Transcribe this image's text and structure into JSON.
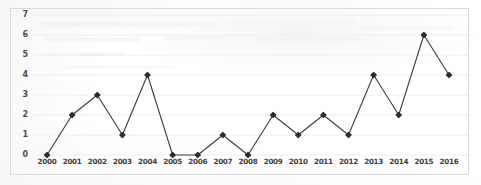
{
  "chart_data": {
    "type": "line",
    "title": "",
    "xlabel": "",
    "ylabel": "",
    "categories": [
      "2000",
      "2001",
      "2002",
      "2003",
      "2004",
      "2005",
      "2006",
      "2007",
      "2008",
      "2009",
      "2010",
      "2011",
      "2012",
      "2013",
      "2014",
      "2015",
      "2016"
    ],
    "values": [
      0,
      2,
      3,
      1,
      4,
      0,
      0,
      1,
      0,
      2,
      1,
      2,
      1,
      4,
      2,
      6,
      4
    ],
    "series": [
      {
        "name": "",
        "values": [
          0,
          2,
          3,
          1,
          4,
          0,
          0,
          1,
          0,
          2,
          1,
          2,
          1,
          4,
          2,
          6,
          4
        ]
      }
    ],
    "ylim": [
      0,
      7
    ],
    "yticks": [
      0,
      1,
      2,
      3,
      4,
      5,
      6,
      7
    ],
    "ytick_labels": [
      "0",
      "1",
      "2",
      "3",
      "4",
      "5",
      "6",
      "7"
    ],
    "xtick_labels": [
      "2000",
      "2001",
      "2002",
      "2003",
      "2004",
      "2005",
      "2006",
      "2007",
      "2008",
      "2009",
      "2010",
      "2011",
      "2012",
      "2013",
      "2014",
      "2015",
      "2016"
    ],
    "grid": true,
    "grid_axis": "y",
    "legend": false,
    "legend_position": "none",
    "marker": "diamond",
    "line_color": "#3a3a3f",
    "marker_color": "#2b2b30",
    "grid_color": "#ececee",
    "frame_color": "#d9d9dc",
    "background_color": "#ffffff"
  },
  "axes": {
    "y_axis_name": "y-axis",
    "x_axis_name": "x-axis"
  }
}
